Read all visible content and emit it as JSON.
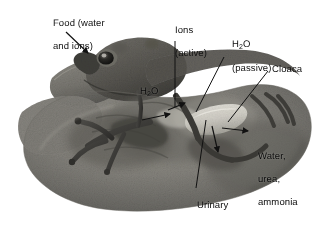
{
  "figure": {
    "background_color": "#ffffff",
    "label_color": "#111111",
    "width": 323,
    "height": 224
  },
  "labels": {
    "food_line1": "Food (water",
    "food_line2": "and ions)",
    "ions_line1": "Ions",
    "ions_line2": "(active)",
    "water_passive_formula_pre": "H",
    "water_passive_formula_sub": "2",
    "water_passive_formula_post": "O",
    "water_passive_line2": "(passive)",
    "cloaca": "Cloaca",
    "h2o_center_pre": "H",
    "h2o_center_sub": "2",
    "h2o_center_post": "O",
    "waste_line1": "Water,",
    "waste_line2": "urea,",
    "waste_line3": "ammonia",
    "bladder_line1": "Urinary",
    "bladder_line2": "bladder"
  },
  "annotations": [
    {
      "name": "food-water-and-ions",
      "target": "mouth"
    },
    {
      "name": "ions-active",
      "target": "skin-surface"
    },
    {
      "name": "h2o-passive",
      "target": "body-wall"
    },
    {
      "name": "cloaca",
      "target": "cloaca-opening"
    },
    {
      "name": "h2o-center",
      "target": "internal-organs"
    },
    {
      "name": "water-urea-ammonia",
      "target": "cloaca-excretion"
    },
    {
      "name": "urinary-bladder",
      "target": "bladder-organ"
    }
  ]
}
